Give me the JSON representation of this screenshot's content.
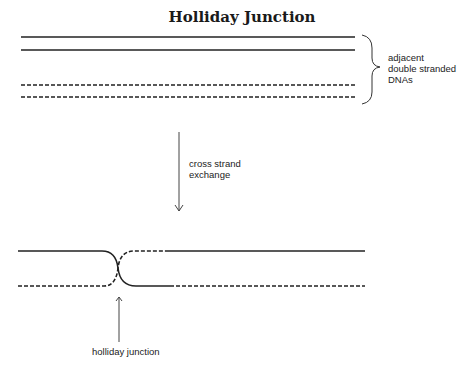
{
  "title": "Holliday Junction",
  "labels": {
    "brace_label_line1": "adjacent",
    "brace_label_line2": "double stranded",
    "brace_label_line3": "DNAs",
    "arrow_label_line1": "cross strand",
    "arrow_label_line2": "exchange",
    "junction_label": "holliday junction"
  },
  "legend_semantics": {
    "solid_line": "DNA strand of first duplex",
    "dashed_line": "DNA strand of second duplex"
  },
  "colors": {
    "line": "#222222",
    "background": "#ffffff"
  }
}
